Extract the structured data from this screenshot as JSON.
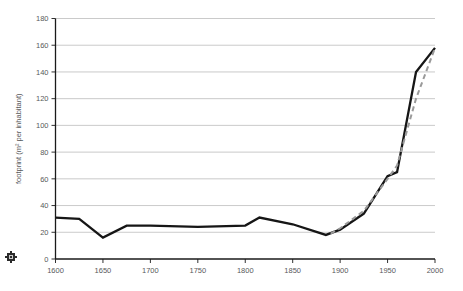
{
  "chart_data": {
    "type": "line",
    "title": "",
    "xlabel": "",
    "ylabel": "footprint (m² per inhabitant)",
    "xlim": [
      1600,
      2000
    ],
    "ylim": [
      0,
      180
    ],
    "grid": true,
    "legend_position": "none",
    "x_ticks": [
      1600,
      1650,
      1700,
      1750,
      1800,
      1850,
      1900,
      1950,
      2000
    ],
    "y_ticks": [
      0,
      20,
      40,
      60,
      80,
      100,
      120,
      140,
      160,
      180
    ],
    "x_tick_labels": [
      "1600",
      "1650",
      "1700",
      "1750",
      "1800",
      "1850",
      "1900",
      "1950",
      "2000"
    ],
    "y_tick_labels": [
      "0",
      "20",
      "40",
      "60",
      "80",
      "100",
      "120",
      "140",
      "160",
      "180"
    ],
    "series": [
      {
        "name": "footprint-solid",
        "style": "solid",
        "color": "#161616",
        "x": [
          1600,
          1625,
          1650,
          1675,
          1700,
          1750,
          1800,
          1815,
          1850,
          1885,
          1900,
          1925,
          1950,
          1960,
          1980,
          2000
        ],
        "values": [
          31,
          30,
          16,
          25,
          25,
          24,
          25,
          31,
          26,
          18,
          22,
          34,
          62,
          65,
          140,
          158
        ]
      },
      {
        "name": "footprint-dashed",
        "style": "dashed",
        "color": "#9a9a9a",
        "x": [
          1890,
          1900,
          1925,
          1950,
          1960,
          1980,
          2000
        ],
        "values": [
          19,
          23,
          36,
          60,
          70,
          120,
          158
        ]
      }
    ]
  },
  "marks": {
    "corner_icon": "square-logo-icon"
  }
}
